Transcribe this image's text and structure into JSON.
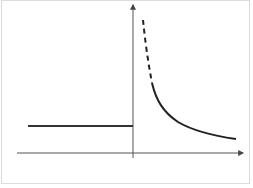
{
  "diagram": {
    "type": "piecewise-function-graph",
    "colors": {
      "axis": "#444444",
      "curve": "#222222",
      "frame": "#dcdcdc",
      "background": "#ffffff"
    },
    "axes": {
      "x_axis": {
        "from": [
          17,
          153
        ],
        "to": [
          243,
          153
        ],
        "arrow": "right"
      },
      "y_axis": {
        "from": [
          133,
          158
        ],
        "to": [
          133,
          5
        ],
        "arrow": "up"
      }
    },
    "segments": [
      {
        "name": "constant-segment",
        "kind": "horizontal-line",
        "from": [
          28,
          126
        ],
        "to": [
          133,
          126
        ],
        "style": "solid"
      },
      {
        "name": "asymptote-dashed-part",
        "kind": "curve",
        "style": "dashed",
        "path": "M143,20 C145,40 148,62 152,83"
      },
      {
        "name": "decay-curve",
        "kind": "curve",
        "style": "solid",
        "path": "M152,83 C156,100 163,112 178,122 C195,132 215,136 236,139"
      }
    ]
  }
}
